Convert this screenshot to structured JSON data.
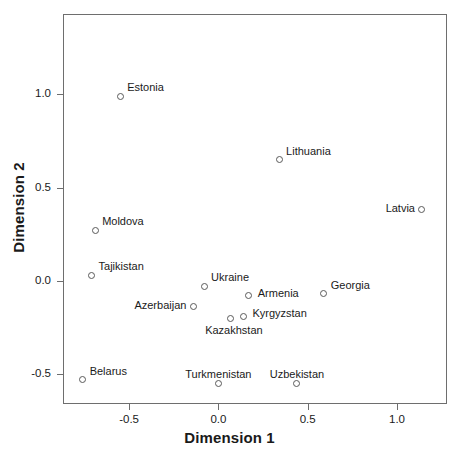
{
  "chart_data": {
    "type": "scatter",
    "title": "",
    "subtitle": "",
    "xlabel": "Dimension 1",
    "ylabel": "Dimension 2",
    "xlim": [
      -0.87,
      1.28
    ],
    "ylim": [
      -0.66,
      1.43
    ],
    "xticks": [
      -0.5,
      0.0,
      0.5,
      1.0
    ],
    "xticklabels": [
      "-0.5",
      "0.0",
      "0.5",
      "1.0"
    ],
    "yticks": [
      -0.5,
      0.0,
      0.5,
      1.0
    ],
    "yticklabels": [
      "-0.5",
      "0.0",
      "0.5",
      "1.0"
    ],
    "grid": false,
    "legend": null,
    "marker": "open-circle",
    "points": [
      {
        "label": "Estonia",
        "x": -0.55,
        "y": 0.99,
        "label_pos": "top-right"
      },
      {
        "label": "Lithuania",
        "x": 0.34,
        "y": 0.65,
        "label_pos": "top-right"
      },
      {
        "label": "Latvia",
        "x": 1.14,
        "y": 0.38,
        "label_pos": "left"
      },
      {
        "label": "Moldova",
        "x": -0.69,
        "y": 0.27,
        "label_pos": "top-right"
      },
      {
        "label": "Tajikistan",
        "x": -0.71,
        "y": 0.03,
        "label_pos": "top-right"
      },
      {
        "label": "Ukraine",
        "x": -0.08,
        "y": -0.03,
        "label_pos": "top-right"
      },
      {
        "label": "Armenia",
        "x": 0.17,
        "y": -0.08,
        "label_pos": "right"
      },
      {
        "label": "Georgia",
        "x": 0.59,
        "y": -0.07,
        "label_pos": "top-right"
      },
      {
        "label": "Azerbaijan",
        "x": -0.14,
        "y": -0.14,
        "label_pos": "left"
      },
      {
        "label": "Kyrgyzstan",
        "x": 0.14,
        "y": -0.19,
        "label_pos": "right"
      },
      {
        "label": "Kazakhstan",
        "x": 0.07,
        "y": -0.2,
        "label_pos": "bottom-left"
      },
      {
        "label": "Belarus",
        "x": -0.76,
        "y": -0.53,
        "label_pos": "top-right"
      },
      {
        "label": "Turkmenistan",
        "x": 0.0,
        "y": -0.55,
        "label_pos": "top"
      },
      {
        "label": "Uzbekistan",
        "x": 0.44,
        "y": -0.55,
        "label_pos": "top"
      }
    ]
  },
  "style": {
    "frame_color": "#6e6e6e",
    "marker_color": "#5a5a5a",
    "text_color": "#1a1a1a",
    "background": "#ffffff"
  }
}
